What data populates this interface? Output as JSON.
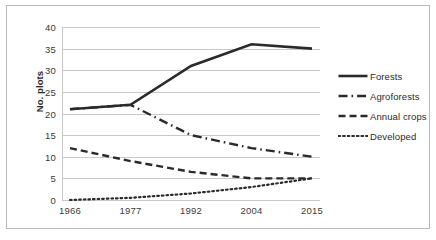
{
  "chart_data": {
    "type": "line",
    "title": "",
    "xlabel": "",
    "ylabel": "No. plots",
    "categories": [
      "1966",
      "1977",
      "1992",
      "2004",
      "2015"
    ],
    "x": [
      1966,
      1977,
      1992,
      2004,
      2015
    ],
    "ylim": [
      0,
      40
    ],
    "ytick_step": 5,
    "yticks": [
      "40",
      "35",
      "30",
      "25",
      "20",
      "15",
      "10",
      "5",
      "0"
    ],
    "grid": "horizontal",
    "legend_position": "right",
    "series": [
      {
        "name": "Forests",
        "style": "solid",
        "color": "#2a2a2a",
        "values": [
          21,
          22,
          31,
          36,
          35
        ]
      },
      {
        "name": "Agroforests",
        "style": "dash-dot",
        "color": "#2a2a2a",
        "values": [
          21,
          22,
          15,
          12,
          10
        ]
      },
      {
        "name": "Annual crops",
        "style": "dashed",
        "color": "#2a2a2a",
        "values": [
          12,
          9,
          6.5,
          5,
          5
        ]
      },
      {
        "name": "Developed",
        "style": "dotted",
        "color": "#2a2a2a",
        "values": [
          0,
          0.5,
          1.5,
          3,
          5
        ]
      }
    ]
  },
  "legend": {
    "items": [
      {
        "label": "Forests"
      },
      {
        "label": "Agroforests"
      },
      {
        "label": "Annual crops"
      },
      {
        "label": "Developed"
      }
    ]
  },
  "colors": {
    "ink": "#2a2a2a",
    "grid": "#c8c8c8",
    "frame": "#b9b9b9",
    "background": "#ffffff"
  }
}
